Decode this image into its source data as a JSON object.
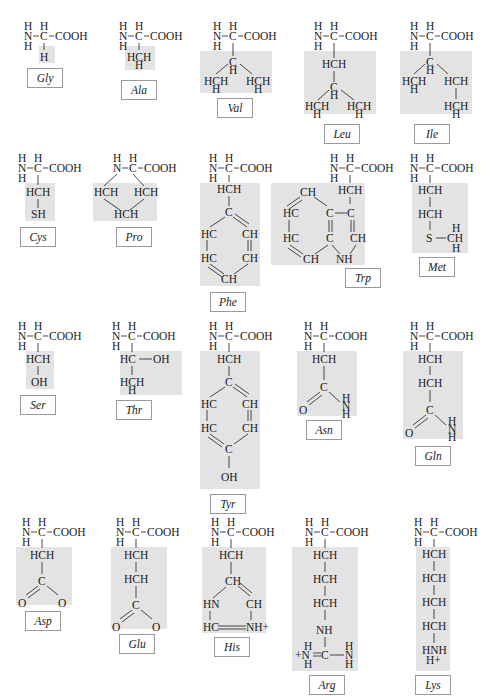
{
  "figure": {
    "backbone": {
      "amine": "N",
      "amine_h": "H",
      "alpha_c": "C",
      "alpha_h": "H",
      "carboxyl": "COOH"
    },
    "shade_color": "#e3e3e3",
    "rows": [
      [
        "Gly",
        "Ala",
        "Val",
        "Leu",
        "Ile"
      ],
      [
        "Cys",
        "Pro",
        "Phe",
        "Trp",
        "Met"
      ],
      [
        "Ser",
        "Thr",
        "Tyr",
        "Asn",
        "Gln"
      ],
      [
        "Asp",
        "Glu",
        "His",
        "Arg",
        "Lys"
      ]
    ]
  },
  "amino_acids": {
    "gly": {
      "label": "Gly",
      "side_chain": [
        "H"
      ]
    },
    "ala": {
      "label": "Ala",
      "side_chain": [
        "HCH",
        "H"
      ]
    },
    "val": {
      "label": "Val",
      "side_chain": [
        "C",
        "H",
        "HCH",
        "H",
        "HCH",
        "H"
      ]
    },
    "leu": {
      "label": "Leu",
      "side_chain": [
        "HCH",
        "C",
        "H",
        "HCH",
        "H",
        "HCH",
        "H"
      ]
    },
    "ile": {
      "label": "Ile",
      "side_chain": [
        "C",
        "H",
        "HCH",
        "H",
        "HCH",
        "HCH",
        "H"
      ]
    },
    "cys": {
      "label": "Cys",
      "side_chain": [
        "HCH",
        "SH"
      ]
    },
    "pro": {
      "label": "Pro",
      "side_chain": [
        "HCH",
        "HCH",
        "HCH"
      ]
    },
    "phe": {
      "label": "Phe",
      "side_chain": [
        "HCH",
        "C",
        "HC",
        "CH",
        "HC",
        "CH",
        "CH"
      ]
    },
    "trp": {
      "label": "Trp",
      "side_chain": [
        "HCH",
        "CH",
        "HC",
        "C",
        "C",
        "HC",
        "C",
        "CH",
        "CH",
        "NH"
      ]
    },
    "met": {
      "label": "Met",
      "side_chain": [
        "HCH",
        "HCH",
        "S",
        "H",
        "CH",
        "H"
      ]
    },
    "ser": {
      "label": "Ser",
      "side_chain": [
        "HCH",
        "OH"
      ]
    },
    "thr": {
      "label": "Thr",
      "side_chain": [
        "HC",
        "OH",
        "HCH",
        "H"
      ]
    },
    "tyr": {
      "label": "Tyr",
      "side_chain": [
        "HCH",
        "C",
        "HC",
        "CH",
        "HC",
        "CH",
        "C",
        "OH"
      ]
    },
    "asn": {
      "label": "Asn",
      "side_chain": [
        "HCH",
        "C",
        "O",
        "H",
        "N",
        "H"
      ]
    },
    "gln": {
      "label": "Gln",
      "side_chain": [
        "HCH",
        "HCH",
        "C",
        "O",
        "H",
        "N",
        "H"
      ]
    },
    "asp": {
      "label": "Asp",
      "side_chain": [
        "HCH",
        "C",
        "O",
        "O"
      ]
    },
    "glu": {
      "label": "Glu",
      "side_chain": [
        "HCH",
        "HCH",
        "C",
        "O",
        "O"
      ]
    },
    "his": {
      "label": "His",
      "side_chain": [
        "HCH",
        "CH",
        "HN",
        "CH",
        "HC",
        "NH+"
      ]
    },
    "arg": {
      "label": "Arg",
      "side_chain": [
        "HCH",
        "HCH",
        "HCH",
        "NH",
        "H",
        "+N",
        "H",
        "C",
        "H",
        "N",
        "H"
      ]
    },
    "lys": {
      "label": "Lys",
      "side_chain": [
        "HCH",
        "HCH",
        "HCH",
        "HCH",
        "HNH",
        "H+"
      ]
    }
  }
}
